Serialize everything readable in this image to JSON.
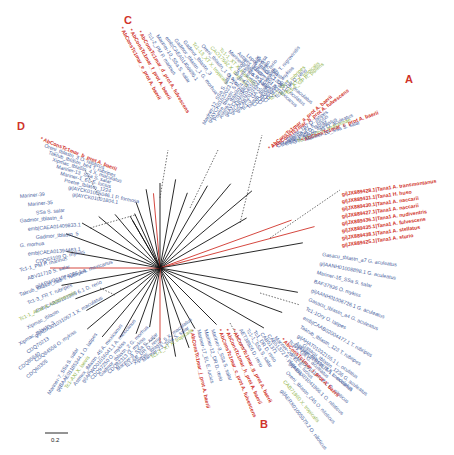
{
  "figure": {
    "type": "unrooted phylogenetic tree",
    "scale_bar": "0.2",
    "clade_labels": [
      "A",
      "B",
      "C",
      "D"
    ]
  },
  "clades": {
    "A": {
      "label": "A",
      "members": [
        {
          "text": "AbConsTc1mar_a_prot A. baerii",
          "color": "red",
          "star": true
        },
        {
          "text": "AbConsTc1mar_b_prot A. fulvescens",
          "color": "red",
          "star": true
        },
        {
          "text": "Chr_tblastn_1b7 O. latipes",
          "color": "blue"
        },
        {
          "text": "Mariner-18_EL E. lucius",
          "color": "blue"
        },
        {
          "text": "CBN81808 D. labrax",
          "color": "blue"
        },
        {
          "text": "Tc1-3_GA G. aculeatus",
          "color": "blue"
        },
        {
          "text": "Oni_tblastn_45 O. aculeatus",
          "color": "blue"
        },
        {
          "text": "Tc1-1_LCh L. chalumnae",
          "color": "green"
        },
        {
          "text": "AbConsTc1mar_c_prot A. baerii",
          "color": "red",
          "star": true
        },
        {
          "text": "Mariner-20_SSa S. salar",
          "color": "blue"
        }
      ],
      "tana_group": [
        "gi|JX889428.1|Tana1 A. transmontanus",
        "gi|JX889431.1|Tana1 H. huso",
        "gi|JX889430.1|Tana1 A. naccarii",
        "gi|JX889427.1|Tana1 A. naccarii",
        "gi|JX889436.1|Tana1 A. nudiventris",
        "gi|JX889435.1|Tana1 A. fulvescens",
        "gi|JX889438.1|Tana1 A. stellatus",
        "gi|JX889425.1|Tana1 A. sturio"
      ]
    },
    "B": {
      "label": "B",
      "members": [
        {
          "text": "AbConsTc1mar_j_prot A. baerii",
          "color": "red",
          "star": true
        },
        {
          "text": "Mariner-17_EL E. lucius",
          "color": "blue"
        },
        {
          "text": "Mariner-12_DR D. rerio",
          "color": "blue"
        },
        {
          "text": "Mariner-9_SSa S. salar",
          "color": "blue"
        },
        {
          "text": "AbConsTc1mar_c_prot A. fulvescens",
          "color": "red",
          "star": true
        },
        {
          "text": "AbConsTc1mar_h_prot A. baerii",
          "color": "red",
          "star": true
        },
        {
          "text": "AbConsTc1mar_g_prot A. baerii",
          "color": "red",
          "star": true
        },
        {
          "text": "AET38926 D. rerio",
          "color": "blue"
        },
        {
          "text": "Tc1-1_SSa S. salar",
          "color": "blue"
        },
        {
          "text": "Tc1_DR D. rerio",
          "color": "blue"
        },
        {
          "text": "CAB51371",
          "color": "blue"
        },
        {
          "text": "CAB51372 P. platessa",
          "color": "blue"
        },
        {
          "text": "Mariner-26_EL E. lucius",
          "color": "blue"
        },
        {
          "text": "AbConsTc1mar_i_prot A. baerii",
          "color": "red",
          "star": true
        },
        {
          "text": "Tc1-1_GA G. aculeatus",
          "color": "blue"
        },
        {
          "text": "Astmex_tblastn_3 A. mexicanus",
          "color": "blue"
        },
        {
          "text": "Gasacu_tblastn_1236 G. aculeatus",
          "color": "blue"
        }
      ]
    },
    "C": {
      "label": "C",
      "members": [
        {
          "text": "AbConsTc1mar_e_prot A. baerii",
          "color": "red",
          "star": true
        },
        {
          "text": "AbConsTc1mar_f_prot A. baerii",
          "color": "red",
          "star": true
        },
        {
          "text": "AbConsTc1mar_d_prot A. fulvescens",
          "color": "red",
          "star": true
        },
        {
          "text": "Tc1-2_PM P. marinus",
          "color": "blue"
        },
        {
          "text": "Mariner-10_SSa S. salar",
          "color": "blue"
        },
        {
          "text": "emb|CAEA01406695.1",
          "color": "blue"
        },
        {
          "text": "Gadmor_tblastn_1 G. morhua",
          "color": "blue"
        },
        {
          "text": "Gadmor_tblastn_3",
          "color": "blue"
        },
        {
          "text": "Tc1-13_XT X. tropicalis",
          "color": "green"
        },
        {
          "text": "Oreni_tblastn_1 O. niloticus",
          "color": "blue"
        },
        {
          "text": "CAO17592 X. tropicalis",
          "color": "green"
        },
        {
          "text": "Tc1-1_XT X. tropicalis",
          "color": "green"
        },
        {
          "text": "Mariner-8_SSa S. salar",
          "color": "blue"
        },
        {
          "text": "Astmex_tblastn_201 A. mexicanus",
          "color": "blue"
        },
        {
          "text": "Lepoc_tblastn_12045 L. oculatus",
          "color": "blue"
        },
        {
          "text": "Xipmac_tblastn_2 X. maculatus",
          "color": "blue"
        }
      ]
    },
    "D": {
      "label": "D",
      "members": [
        {
          "text": "AbConsTc1mar_b_prot A. baerii",
          "color": "red",
          "star": true
        },
        {
          "text": "Oreni_tblastn_3 O. niloticus",
          "color": "blue"
        },
        {
          "text": "Takrub_tblastn_be4 T. rubripes",
          "color": "blue"
        },
        {
          "text": "Xipmac_tblastn_4 X. maculatus",
          "color": "blue"
        },
        {
          "text": "Mariner-13_SSa S. salar",
          "color": "blue"
        },
        {
          "text": "Mariner-1_EL E. lucius",
          "color": "blue"
        },
        {
          "text": "Poetre_tblastn_1224",
          "color": "blue"
        },
        {
          "text": "gi|AYCK01005046.1 P. formosa",
          "color": "blue"
        },
        {
          "text": "gi|AYCK01001804.1",
          "color": "blue"
        }
      ]
    }
  },
  "ungrouped": {
    "top": [
      {
        "text": "Mariner-12_SSa S. salar",
        "color": "blue"
      },
      {
        "text": "gi|AYCK01022023.1 P. formosa",
        "color": "blue"
      },
      {
        "text": "Poetre_tblastn_5 P. formosa",
        "color": "blue"
      },
      {
        "text": "Astmex_tblastn_4 A. mexicanus",
        "color": "blue"
      },
      {
        "text": "gi|AYCK01014037.1 P. formosa",
        "color": "blue"
      },
      {
        "text": "gi|CABZ01045501.1 D. rerio",
        "color": "blue"
      },
      {
        "text": "gi|CABZ01039444.1 D. rerio",
        "color": "blue"
      },
      {
        "text": "Tc1-3_GA G. aculeatus",
        "color": "blue"
      },
      {
        "text": "Takrub_tblastn_1237 T. nigroviridis",
        "color": "blue"
      },
      {
        "text": "CDQ80568",
        "color": "blue"
      },
      {
        "text": "CDQ69997 O. mykiss",
        "color": "blue"
      },
      {
        "text": "CDQ83398",
        "color": "blue"
      },
      {
        "text": "Tc1-1_TR T. rubripes",
        "color": "green"
      },
      {
        "text": "Tc1-1_DR D. rerio",
        "color": "blue"
      },
      {
        "text": "Tc1-1_XT X. tropicalis",
        "color": "green"
      },
      {
        "text": "Tc1-1_GP R. pipiens",
        "color": "green"
      }
    ],
    "left": [
      {
        "text": "Mariner-39",
        "color": "blue"
      },
      {
        "text": "Mariner-35",
        "color": "blue"
      },
      {
        "text": "SSa S. salar",
        "color": "blue"
      },
      {
        "text": "Gadmor_tblastn_4",
        "color": "blue"
      },
      {
        "text": "emb|CAEA01409833.1",
        "color": "blue"
      },
      {
        "text": "Gadmor_tblastn_5",
        "color": "blue"
      },
      {
        "text": "G. morhua",
        "color": "blue"
      },
      {
        "text": "emb|CAEA01394463.1",
        "color": "blue"
      },
      {
        "text": "CDQ63109 O. mykiss",
        "color": "blue"
      },
      {
        "text": "Tc1-1_PM P. marinus",
        "color": "blue"
      },
      {
        "text": "ABV31710 S. salar",
        "color": "blue"
      },
      {
        "text": "gi|APWO01074085.1 A. mexicanus",
        "color": "blue"
      },
      {
        "text": "Takrub_tblastn_ba5 T. rubripes",
        "color": "blue"
      },
      {
        "text": "Tc1-3_FR T. rubripes",
        "color": "blue"
      },
      {
        "text": "emb|CAB20101989 6.1 D. rerio",
        "color": "blue"
      },
      {
        "text": "Tc1-1_ACar A. carolinensis",
        "color": "green"
      },
      {
        "text": "Xipmac_tblastn",
        "color": "blue"
      },
      {
        "text": "gi|ADAJ01031057.1 X. maculatus",
        "color": "blue"
      },
      {
        "text": "Xipmac_tblastn_3",
        "color": "blue"
      },
      {
        "text": "CDQ70213",
        "color": "blue"
      },
      {
        "text": "CDQ84558 O. mykiss",
        "color": "blue"
      },
      {
        "text": "CDQ85840",
        "color": "blue"
      },
      {
        "text": "CDQ60305",
        "color": "blue"
      }
    ],
    "bottom_left": [
      {
        "text": "Mariner-7_SSa S. salar",
        "color": "blue"
      },
      {
        "text": "gi|BAAE01185344.1 O. latipes",
        "color": "blue"
      },
      {
        "text": "Tc1-AXI X. laevis",
        "color": "green"
      },
      {
        "text": "Astmex_tblastn_45 A. mexicanus",
        "color": "blue"
      },
      {
        "text": "gi|APWO01016041.1 A. mexicanus",
        "color": "blue"
      },
      {
        "text": "CDQ97250 O. mykiss",
        "color": "blue"
      },
      {
        "text": "Gadmor_tblastn_2 G. morhua",
        "color": "blue"
      },
      {
        "text": "CDQ82313 O. mykiss",
        "color": "blue"
      },
      {
        "text": "Mariner-9_SSa S. salar",
        "color": "blue"
      },
      {
        "text": "Tc1-6B_DR D. rerio",
        "color": "blue"
      },
      {
        "text": "Xipmac_tblastn_5 X. maculatus",
        "color": "blue"
      },
      {
        "text": "Mariner-23_SSa S. salar",
        "color": "blue"
      },
      {
        "text": "Tc1-1_XT X. tropicalis",
        "color": "green"
      }
    ],
    "right": [
      {
        "text": "Gasacu_tblastn_a7 G. aculeatus",
        "color": "blue"
      },
      {
        "text": "gi|AANH01008898.1 G. aculeatus",
        "color": "blue"
      },
      {
        "text": "Mariner-16_SSa S. salar",
        "color": "blue"
      },
      {
        "text": "BAF37936 O. mykiss",
        "color": "blue"
      },
      {
        "text": "gi|AANH01006726.1 G. aculeatus",
        "color": "blue"
      },
      {
        "text": "Gasacu_tblastn_a4 G. aculeatus",
        "color": "blue"
      },
      {
        "text": "Tc1-1Ory O. latipes",
        "color": "blue"
      },
      {
        "text": "emb|CAAB02004477.1 T. rubripes",
        "color": "blue"
      },
      {
        "text": "Takrub_tblastn_123 T. rubripes",
        "color": "blue"
      },
      {
        "text": "gi|AHAT01032155.1 L. oculatus",
        "color": "blue"
      },
      {
        "text": "gi|AHAT01013876.1 L. oculatus",
        "color": "blue"
      },
      {
        "text": "gi|AERX01016728.2 O. niloticus",
        "color": "blue"
      },
      {
        "text": "gi|AERX01041866.1 O. niloticus",
        "color": "blue"
      },
      {
        "text": "Oreni_tblastn_245 O. niloticus",
        "color": "blue"
      },
      {
        "text": "CAB71960 X. tropicalis",
        "color": "green"
      },
      {
        "text": "gi|AERX01005579.2 O. niloticus",
        "color": "blue"
      }
    ]
  },
  "colors": {
    "sturgeon_red": "#d0332a",
    "fish_blue": "#4a5f9e",
    "tetrapod_green": "#8fb34a",
    "branch_black": "#111111"
  }
}
